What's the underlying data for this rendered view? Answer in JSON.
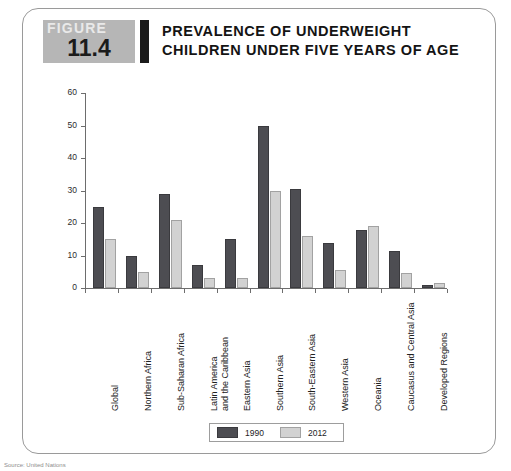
{
  "figure": {
    "badge_word": "FIGURE",
    "badge_number": "11.4",
    "title": "PREVALENCE OF UNDERWEIGHT CHILDREN UNDER FIVE YEARS OF AGE"
  },
  "legend": {
    "series_1_label": "1990",
    "series_2_label": "2012"
  },
  "colors": {
    "series_1990": "#4d4d52",
    "series_2012": "#d2d2d2",
    "axis": "#6d6d6d",
    "badge_background": "#b6b6b6"
  },
  "source_note": "Source: United Nations",
  "chart_data": {
    "type": "bar",
    "title": "PREVALENCE OF UNDERWEIGHT CHILDREN UNDER FIVE YEARS OF AGE",
    "xlabel": "",
    "ylabel": "",
    "ylim": [
      0,
      60
    ],
    "yticks": [
      0,
      10,
      20,
      30,
      40,
      50,
      60
    ],
    "grid": false,
    "legend_position": "bottom",
    "categories": [
      "Global",
      "Northern Africa",
      "Sub-Saharan Africa",
      "Latin America\nand the Caribbean",
      "Eastern Asia",
      "Southern Asia",
      "South-Eastern Asia",
      "Western Asia",
      "Oceania",
      "Caucasus and Central Asia",
      "Developed Regions"
    ],
    "series": [
      {
        "name": "1990",
        "values": [
          25,
          10,
          29,
          7,
          15,
          50,
          30.5,
          14,
          18,
          11.5,
          1
        ]
      },
      {
        "name": "2012",
        "values": [
          15,
          5,
          21,
          3,
          3,
          30,
          16,
          5.5,
          19,
          4.5,
          1.5
        ]
      }
    ]
  }
}
